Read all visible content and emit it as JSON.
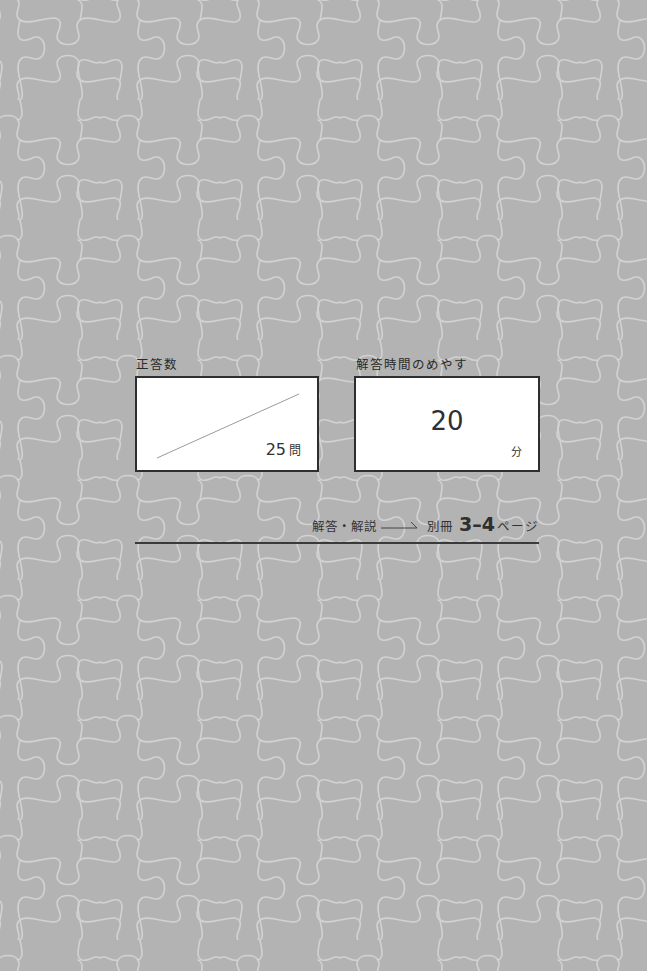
{
  "background": {
    "color": "#b3b3b3",
    "pattern": "jigsaw-puzzle",
    "pattern_line_color": "#d4d4d4"
  },
  "score_box": {
    "label": "正答数",
    "total": "25",
    "unit": "問"
  },
  "time_box": {
    "label": "解答時間のめやす",
    "value": "20",
    "unit": "分"
  },
  "answer_reference": {
    "text": "解答・解説",
    "arrow": "→",
    "volume": "別冊",
    "pages": "3–4",
    "page_suffix": "ページ"
  }
}
